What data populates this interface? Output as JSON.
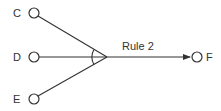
{
  "diagram": {
    "type": "rule-inference",
    "colors": {
      "stroke": "#333333",
      "background": "#ffffff"
    },
    "inputs": [
      {
        "id": "C",
        "label": "C"
      },
      {
        "id": "D",
        "label": "D"
      },
      {
        "id": "E",
        "label": "E"
      }
    ],
    "rule": {
      "label": "Rule 2",
      "conjunction": "AND (arc)"
    },
    "output": {
      "id": "F",
      "label": "F"
    }
  }
}
